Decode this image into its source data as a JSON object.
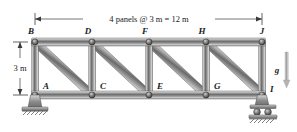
{
  "figure": {
    "type": "truss-diagram",
    "background_color": "#ffffff",
    "member_color": "#9a9a9a",
    "member_dark": "#5c5c5c",
    "member_light": "#e2e2e2",
    "line_color": "#1a1a1a"
  },
  "dimensions": {
    "span": {
      "label": "4 panels @ 3 m = 12 m",
      "panels": 4,
      "panel_length_m": 3,
      "total_m": 12
    },
    "height": {
      "label": "3 m",
      "value_m": 3
    }
  },
  "gravity": {
    "label": "g",
    "direction": "down"
  },
  "joints": {
    "top": [
      {
        "label": "B",
        "x": 35,
        "y": 42
      },
      {
        "label": "D",
        "x": 92,
        "y": 42
      },
      {
        "label": "F",
        "x": 149,
        "y": 42
      },
      {
        "label": "H",
        "x": 206,
        "y": 42
      },
      {
        "label": "J",
        "x": 262,
        "y": 42
      }
    ],
    "bottom": [
      {
        "label": "A",
        "x": 35,
        "y": 95
      },
      {
        "label": "C",
        "x": 92,
        "y": 95
      },
      {
        "label": "E",
        "x": 149,
        "y": 95
      },
      {
        "label": "G",
        "x": 206,
        "y": 95
      },
      {
        "label": "I",
        "x": 262,
        "y": 95
      }
    ]
  },
  "supports": {
    "left": {
      "type": "pin",
      "at_joint": "A"
    },
    "right": {
      "type": "roller",
      "at_joint": "I"
    }
  },
  "labels": {
    "B": "B",
    "D": "D",
    "F": "F",
    "H": "H",
    "J": "J",
    "A": "A",
    "C": "C",
    "E": "E",
    "G": "G",
    "I": "I"
  }
}
